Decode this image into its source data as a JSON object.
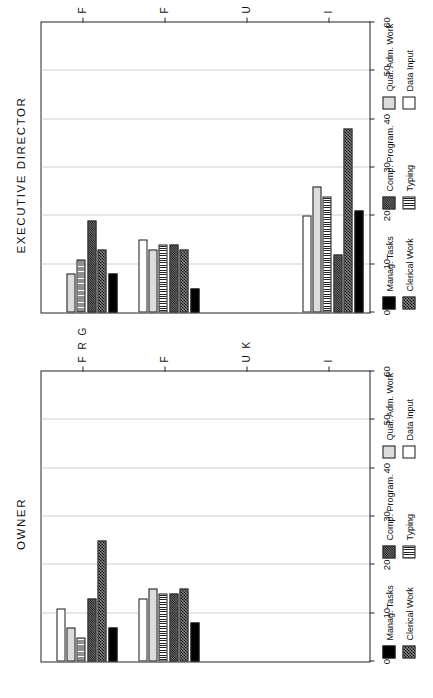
{
  "figure": {
    "panels": [
      "OWNER",
      "EXECUTIVE DIRECTOR"
    ]
  },
  "legend": {
    "items": [
      {
        "label": "Manag. Tasks",
        "key": "manag",
        "fill": "solid-black"
      },
      {
        "label": "Clerical Work",
        "key": "clerical",
        "fill": "dark-crosshatch"
      },
      {
        "label": "Comp. Program.",
        "key": "comp",
        "fill": "dark-checker"
      },
      {
        "label": "Typing",
        "key": "typing",
        "fill": "vertical-lines"
      },
      {
        "label": "Qual. Adm. Work",
        "key": "qual",
        "fill": "light-gray"
      },
      {
        "label": "Data Input",
        "key": "data",
        "fill": "white"
      }
    ]
  },
  "chart_data": [
    {
      "type": "bar",
      "orientation": "horizontal",
      "title": "EXECUTIVE DIRECTOR",
      "xlabel": "",
      "ylabel": "",
      "xlim": [
        0,
        60
      ],
      "xticks": [
        0,
        10,
        20,
        30,
        40,
        50,
        60
      ],
      "grid": true,
      "categories": [
        "I",
        "U K",
        "F",
        "F R G"
      ],
      "series": [
        {
          "name": "Manag. Tasks",
          "values": [
            21,
            0,
            5,
            8
          ]
        },
        {
          "name": "Clerical Work",
          "values": [
            38,
            0,
            13,
            13
          ]
        },
        {
          "name": "Comp. Program.",
          "values": [
            12,
            0,
            14,
            19
          ]
        },
        {
          "name": "Typing",
          "values": [
            24,
            0,
            14,
            11
          ]
        },
        {
          "name": "Qual. Adm. Work",
          "values": [
            26,
            0,
            13,
            8
          ]
        },
        {
          "name": "Data Input",
          "values": [
            20,
            0,
            15,
            0
          ]
        }
      ]
    },
    {
      "type": "bar",
      "orientation": "horizontal",
      "title": "OWNER",
      "xlabel": "",
      "ylabel": "",
      "xlim": [
        0,
        60
      ],
      "xticks": [
        0,
        10,
        20,
        30,
        40,
        50,
        60
      ],
      "grid": true,
      "categories": [
        "I",
        "U K",
        "F",
        "F R G"
      ],
      "series": [
        {
          "name": "Manag. Tasks",
          "values": [
            0,
            0,
            8,
            7
          ]
        },
        {
          "name": "Clerical Work",
          "values": [
            0,
            0,
            15,
            25
          ]
        },
        {
          "name": "Comp. Program.",
          "values": [
            0,
            0,
            14,
            13
          ]
        },
        {
          "name": "Typing",
          "values": [
            0,
            0,
            14,
            5
          ]
        },
        {
          "name": "Qual. Adm. Work",
          "values": [
            0,
            0,
            15,
            7
          ]
        },
        {
          "name": "Data Input",
          "values": [
            0,
            0,
            13,
            11
          ]
        }
      ]
    }
  ]
}
